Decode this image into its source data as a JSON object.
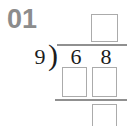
{
  "problem": {
    "number": "01",
    "divisor": "9",
    "dividend_digits": [
      "6",
      "8"
    ],
    "bracket_glyph": ")",
    "answer_boxes": {
      "quotient": "",
      "work_tens": "",
      "work_ones": "",
      "remainder": ""
    }
  },
  "colors": {
    "background": "#ffffff",
    "problem_number_gray": "#8c8c8c",
    "digit_color": "#1c1c1c",
    "line_gray": "#909090",
    "box_border_gray": "#ababab"
  }
}
